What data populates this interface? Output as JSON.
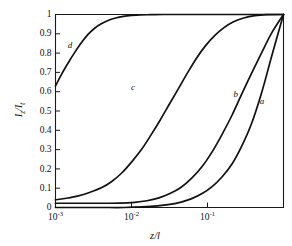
{
  "chart_data": {
    "type": "line",
    "title": "",
    "subtitle": "",
    "xlabel": "z/l",
    "ylabel": "Iz / It",
    "xscale": "log",
    "yscale": "linear",
    "xlim": [
      0.001,
      1.0
    ],
    "ylim": [
      0,
      1
    ],
    "grid": false,
    "legend_position": "inline-curve-labels",
    "xticks": [
      {
        "value": 0.001,
        "mantissa": "10",
        "exponent": "-3"
      },
      {
        "value": 0.01,
        "mantissa": "10",
        "exponent": "-2"
      },
      {
        "value": 0.1,
        "mantissa": "10",
        "exponent": "-1"
      }
    ],
    "yticks": [
      "0",
      "0.1",
      "0.2",
      "0.3",
      "0.4",
      "0.5",
      "0.6",
      "0.7",
      "0.8",
      "0.9",
      "1"
    ],
    "ytick_values": [
      0,
      0.1,
      0.2,
      0.3,
      0.4,
      0.5,
      0.6,
      0.7,
      0.8,
      0.9,
      1
    ],
    "series": [
      {
        "name": "a",
        "label": "a",
        "label_x": 0.52,
        "label_y": 0.545,
        "x": [
          0.001,
          0.002,
          0.004,
          0.008,
          0.014,
          0.022,
          0.032,
          0.045,
          0.062,
          0.085,
          0.115,
          0.155,
          0.21,
          0.28,
          0.38,
          0.52,
          0.7,
          1.0
        ],
        "y": [
          0.0,
          0.0,
          0.0,
          0.0,
          0.003,
          0.008,
          0.016,
          0.028,
          0.046,
          0.072,
          0.108,
          0.158,
          0.225,
          0.315,
          0.435,
          0.6,
          0.785,
          1.0
        ]
      },
      {
        "name": "b",
        "label": "b",
        "label_x": 0.235,
        "label_y": 0.585,
        "x": [
          0.001,
          0.002,
          0.004,
          0.007,
          0.011,
          0.016,
          0.023,
          0.032,
          0.045,
          0.062,
          0.085,
          0.115,
          0.155,
          0.21,
          0.28,
          0.38,
          0.52,
          0.7,
          1.0
        ],
        "y": [
          0.022,
          0.022,
          0.022,
          0.023,
          0.027,
          0.035,
          0.05,
          0.072,
          0.105,
          0.152,
          0.212,
          0.288,
          0.378,
          0.478,
          0.585,
          0.695,
          0.805,
          0.905,
          1.0
        ]
      },
      {
        "name": "c",
        "label": "c",
        "label_x": 0.0105,
        "label_y": 0.62,
        "x": [
          0.001,
          0.0014,
          0.002,
          0.0028,
          0.004,
          0.0055,
          0.0075,
          0.01,
          0.0135,
          0.018,
          0.024,
          0.032,
          0.042,
          0.055,
          0.072,
          0.095,
          0.125,
          0.165,
          0.22,
          0.3,
          0.42,
          0.6,
          1.0
        ],
        "y": [
          0.04,
          0.048,
          0.06,
          0.078,
          0.102,
          0.135,
          0.18,
          0.235,
          0.3,
          0.375,
          0.455,
          0.54,
          0.62,
          0.7,
          0.775,
          0.84,
          0.892,
          0.932,
          0.962,
          0.982,
          0.994,
          0.999,
          1.0
        ]
      },
      {
        "name": "d",
        "label": "d",
        "label_x": 0.00155,
        "label_y": 0.835,
        "x": [
          0.001,
          0.0012,
          0.0015,
          0.0018,
          0.0022,
          0.0027,
          0.0033,
          0.004,
          0.005,
          0.0062,
          0.0078,
          0.01,
          0.013,
          0.018,
          0.026,
          0.04,
          0.07,
          0.15,
          0.4,
          1.0
        ],
        "y": [
          0.63,
          0.69,
          0.755,
          0.805,
          0.855,
          0.898,
          0.93,
          0.952,
          0.97,
          0.982,
          0.99,
          0.995,
          0.998,
          0.999,
          1.0,
          1.0,
          1.0,
          1.0,
          1.0,
          1.0
        ]
      }
    ]
  },
  "axes": {
    "ylabel_numerator": "I",
    "ylabel_num_sub": "z",
    "ylabel_slash": "/",
    "ylabel_denominator": "I",
    "ylabel_den_sub": "t",
    "xlabel_numerator": "z",
    "xlabel_slash": "/",
    "xlabel_denominator": "l"
  },
  "style": {
    "axis_color": "#1a1a1a",
    "curve_color": "#111111",
    "background": "#ffffff"
  }
}
